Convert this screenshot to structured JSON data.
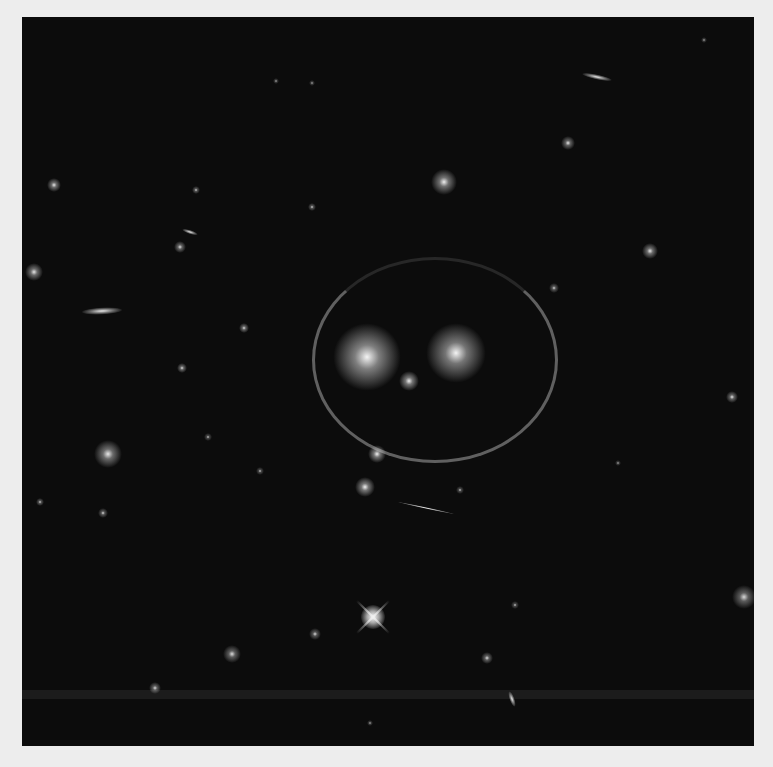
{
  "image": {
    "subject": "galaxy cluster with gravitational lensing arcs forming a smiley face",
    "background": "#ededed",
    "field_color": "#0c0c0c",
    "artifact_band_y": 673
  },
  "objects": [
    {
      "name": "left-eye-galaxy",
      "x": 345,
      "y": 340,
      "r": 34,
      "core": "#f4f4f4",
      "glow": "rgba(220,220,220,0.55)"
    },
    {
      "name": "right-eye-galaxy",
      "x": 434,
      "y": 336,
      "r": 30,
      "core": "#f4f4f4",
      "glow": "rgba(220,220,220,0.5)"
    },
    {
      "name": "nose-galaxy",
      "x": 387,
      "y": 364,
      "r": 10,
      "core": "#eeeeee",
      "glow": "rgba(220,220,220,0.5)"
    },
    {
      "name": "small-galaxy-1",
      "x": 355,
      "y": 437,
      "r": 9,
      "core": "#f2f2f2",
      "glow": "rgba(220,220,220,0.5)"
    },
    {
      "name": "small-galaxy-2",
      "x": 343,
      "y": 470,
      "r": 10,
      "core": "#f2f2f2",
      "glow": "rgba(220,220,220,0.5)"
    },
    {
      "name": "bright-galaxy-top",
      "x": 422,
      "y": 165,
      "r": 13,
      "core": "#eeeeee",
      "glow": "rgba(210,210,210,0.5)"
    },
    {
      "name": "spiral-galaxy",
      "x": 86,
      "y": 437,
      "r": 14,
      "core": "#e8e8e8",
      "glow": "rgba(200,200,200,0.5)"
    },
    {
      "name": "left-galaxy-1",
      "x": 12,
      "y": 255,
      "r": 9,
      "core": "#e6e6e6",
      "glow": "rgba(200,200,200,0.5)"
    },
    {
      "name": "left-galaxy-2",
      "x": 32,
      "y": 168,
      "r": 7,
      "core": "#e6e6e6",
      "glow": "rgba(200,200,200,0.5)"
    },
    {
      "name": "mid-galaxy-1",
      "x": 158,
      "y": 230,
      "r": 6,
      "core": "#e0e0e0",
      "glow": "rgba(200,200,200,0.45)"
    },
    {
      "name": "mid-galaxy-2",
      "x": 222,
      "y": 311,
      "r": 5,
      "core": "#e0e0e0",
      "glow": "rgba(200,200,200,0.45)"
    },
    {
      "name": "mid-galaxy-3",
      "x": 160,
      "y": 351,
      "r": 5,
      "core": "#e0e0e0",
      "glow": "rgba(200,200,200,0.45)"
    },
    {
      "name": "right-galaxy-1",
      "x": 628,
      "y": 234,
      "r": 8,
      "core": "#e6e6e6",
      "glow": "rgba(200,200,200,0.5)"
    },
    {
      "name": "right-galaxy-2",
      "x": 710,
      "y": 380,
      "r": 6,
      "core": "#e6e6e6",
      "glow": "rgba(200,200,200,0.45)"
    },
    {
      "name": "right-edge-galaxy",
      "x": 722,
      "y": 580,
      "r": 12,
      "core": "#d8d8d8",
      "glow": "rgba(190,190,190,0.45)"
    },
    {
      "name": "upper-right-galaxy",
      "x": 546,
      "y": 126,
      "r": 7,
      "core": "#e6e6e6",
      "glow": "rgba(200,200,200,0.45)"
    },
    {
      "name": "lower-galaxy-1",
      "x": 465,
      "y": 641,
      "r": 6,
      "core": "#dedede",
      "glow": "rgba(190,190,190,0.45)"
    },
    {
      "name": "lower-galaxy-2",
      "x": 210,
      "y": 637,
      "r": 9,
      "core": "#dcdcdc",
      "glow": "rgba(190,190,190,0.45)"
    },
    {
      "name": "lower-galaxy-3",
      "x": 133,
      "y": 671,
      "r": 6,
      "core": "#dcdcdc",
      "glow": "rgba(190,190,190,0.45)"
    },
    {
      "name": "lower-galaxy-4",
      "x": 293,
      "y": 617,
      "r": 6,
      "core": "#dadada",
      "glow": "rgba(190,190,190,0.4)"
    },
    {
      "name": "left-lower-1",
      "x": 81,
      "y": 496,
      "r": 5,
      "core": "#dedede",
      "glow": "rgba(190,190,190,0.4)"
    },
    {
      "name": "left-lower-2",
      "x": 18,
      "y": 485,
      "r": 4,
      "core": "#d8d8d8",
      "glow": "rgba(190,190,190,0.4)"
    },
    {
      "name": "field-star-1",
      "x": 290,
      "y": 66,
      "r": 3,
      "core": "#cccccc",
      "glow": "rgba(180,180,180,0.3)"
    },
    {
      "name": "field-star-2",
      "x": 174,
      "y": 173,
      "r": 4,
      "core": "#d8d8d8",
      "glow": "rgba(190,190,190,0.4)"
    },
    {
      "name": "field-star-3",
      "x": 254,
      "y": 64,
      "r": 3,
      "core": "#cccccc",
      "glow": "rgba(180,180,180,0.3)"
    },
    {
      "name": "field-star-4",
      "x": 290,
      "y": 190,
      "r": 4,
      "core": "#d8d8d8",
      "glow": "rgba(190,190,190,0.4)"
    },
    {
      "name": "field-star-5",
      "x": 532,
      "y": 271,
      "r": 5,
      "core": "#d8d8d8",
      "glow": "rgba(190,190,190,0.4)"
    },
    {
      "name": "field-star-6",
      "x": 238,
      "y": 454,
      "r": 4,
      "core": "#d0d0d0",
      "glow": "rgba(180,180,180,0.35)"
    },
    {
      "name": "field-star-7",
      "x": 438,
      "y": 473,
      "r": 4,
      "core": "#d0d0d0",
      "glow": "rgba(180,180,180,0.35)"
    },
    {
      "name": "field-star-8",
      "x": 493,
      "y": 588,
      "r": 4,
      "core": "#d0d0d0",
      "glow": "rgba(180,180,180,0.35)"
    },
    {
      "name": "field-star-9",
      "x": 348,
      "y": 706,
      "r": 3,
      "core": "#cccccc",
      "glow": "rgba(180,180,180,0.3)"
    },
    {
      "name": "field-star-10",
      "x": 186,
      "y": 420,
      "r": 4,
      "core": "#d0d0d0",
      "glow": "rgba(180,180,180,0.35)"
    },
    {
      "name": "field-star-11",
      "x": 596,
      "y": 446,
      "r": 3,
      "core": "#cccccc",
      "glow": "rgba(180,180,180,0.3)"
    },
    {
      "name": "field-star-12",
      "x": 682,
      "y": 23,
      "r": 3,
      "core": "#cccccc",
      "glow": "rgba(180,180,180,0.3)"
    }
  ],
  "elongated": [
    {
      "name": "edge-on-galaxy-left",
      "x": 80,
      "y": 294,
      "w": 40,
      "h": 7,
      "angle": -3
    },
    {
      "name": "edge-on-galaxy-top-right",
      "x": 575,
      "y": 60,
      "w": 30,
      "h": 5,
      "angle": 12
    },
    {
      "name": "edge-on-galaxy-mid",
      "x": 168,
      "y": 215,
      "w": 16,
      "h": 4,
      "angle": 18
    },
    {
      "name": "lower-streak",
      "x": 490,
      "y": 682,
      "w": 16,
      "h": 5,
      "angle": 70
    },
    {
      "name": "lensed-streak",
      "x": 404,
      "y": 491,
      "w": 60,
      "h": 2,
      "angle": 12
    }
  ],
  "lensing_ring": {
    "cx": 410,
    "cy": 340,
    "rx": 120,
    "ry": 100,
    "thickness": 3
  },
  "bright_star": {
    "name": "diffraction-spike-star",
    "x": 351,
    "y": 600,
    "size": 46
  }
}
